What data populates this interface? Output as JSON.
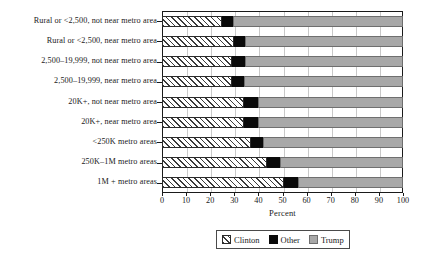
{
  "chart_data": {
    "type": "bar",
    "orientation": "horizontal",
    "stacked": true,
    "title": "",
    "xlabel": "Percent",
    "ylabel": "",
    "xlim": [
      0,
      100
    ],
    "xticks": [
      0,
      10,
      20,
      30,
      40,
      50,
      60,
      70,
      80,
      90,
      100
    ],
    "grid": true,
    "legend_position": "bottom",
    "categories": [
      "Rural or <2,500, not near metro area",
      "Rural or <2,500, near metro area",
      "2,500–19,999, not near metro area",
      "2,500–19,999, near metro area",
      "20K+, not near metro area",
      "20K+, near metro area",
      "<250K metro areas",
      "250K–1M metro areas",
      "1M + metro areas"
    ],
    "series": [
      {
        "name": "Clinton",
        "color": "#ffffff",
        "pattern": "diagonal-hatch",
        "values": [
          25,
          30,
          29,
          29,
          34,
          34,
          37,
          43.5,
          50.5
        ]
      },
      {
        "name": "Other",
        "color": "#0a0a0a",
        "pattern": "solid",
        "values": [
          4.5,
          4.5,
          5.5,
          5,
          6,
          6,
          5,
          5.5,
          6
        ]
      },
      {
        "name": "Trump",
        "color": "#a8a8a8",
        "pattern": "solid",
        "values": [
          70.5,
          65.5,
          65.5,
          66,
          60,
          60,
          58,
          51,
          43.5
        ]
      }
    ]
  },
  "axis": {
    "x_title": "Percent",
    "tick_labels": [
      "0",
      "10",
      "20",
      "30",
      "40",
      "50",
      "60",
      "70",
      "80",
      "90",
      "100"
    ]
  },
  "legend": {
    "items": [
      {
        "label": "Clinton",
        "swatch": "hatch-swatch-icon"
      },
      {
        "label": "Other",
        "swatch": "black-swatch-icon"
      },
      {
        "label": "Trump",
        "swatch": "gray-swatch-icon"
      }
    ]
  }
}
